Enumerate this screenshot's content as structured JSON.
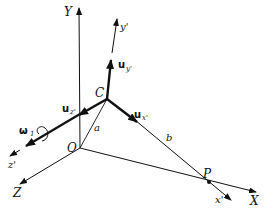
{
  "figure": {
    "type": "3D coordinate frame diagram",
    "labels": {
      "Y": "Y",
      "X": "X",
      "Z": "Z",
      "y_prime": "y'",
      "x_prime": "x'",
      "z_prime": "z'",
      "origin": "O",
      "C": "C",
      "P": "P",
      "a": "a",
      "b": "b",
      "u_y_bold": "u",
      "u_y_sub": "y'",
      "u_x_bold": "u",
      "u_x_sub": "x'",
      "u_z_bold": "u",
      "u_z_sub": "z'",
      "omega_sym": "ω",
      "omega_sub": "1"
    },
    "colors": {
      "ink": "#111111",
      "background": "#ffffff"
    }
  }
}
